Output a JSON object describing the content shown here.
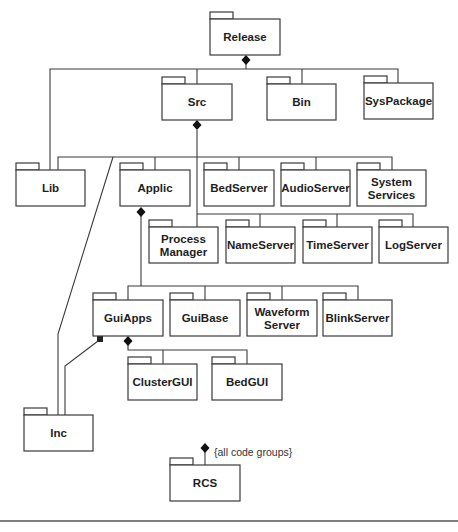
{
  "diagram": {
    "type": "UML package diagram",
    "packages": {
      "release": {
        "label": [
          "Release"
        ]
      },
      "src": {
        "label": [
          "Src"
        ]
      },
      "bin": {
        "label": [
          "Bin"
        ]
      },
      "syspackage": {
        "label": [
          "SysPackage"
        ]
      },
      "lib": {
        "label": [
          "Lib"
        ]
      },
      "applic": {
        "label": [
          "Applic"
        ]
      },
      "bedserver": {
        "label": [
          "BedServer"
        ]
      },
      "audioserver": {
        "label": [
          "AudioServer"
        ]
      },
      "systemservices": {
        "label": [
          "System",
          "Services"
        ]
      },
      "processmanager": {
        "label": [
          "Process",
          "Manager"
        ]
      },
      "nameserver": {
        "label": [
          "NameServer"
        ]
      },
      "timeserver": {
        "label": [
          "TimeServer"
        ]
      },
      "logserver": {
        "label": [
          "LogServer"
        ]
      },
      "guiapps": {
        "label": [
          "GuiApps"
        ]
      },
      "guibase": {
        "label": [
          "GuiBase"
        ]
      },
      "waveformserver": {
        "label": [
          "Waveform",
          "Server"
        ]
      },
      "blinkserver": {
        "label": [
          "BlinkServer"
        ]
      },
      "clustergui": {
        "label": [
          "ClusterGUI"
        ]
      },
      "bedgui": {
        "label": [
          "BedGUI"
        ]
      },
      "inc": {
        "label": [
          "Inc"
        ]
      },
      "rcs": {
        "label": [
          "RCS"
        ]
      }
    },
    "relations": [
      {
        "kind": "composition",
        "whole": "Release",
        "parts": [
          "Src",
          "Bin",
          "SysPackage",
          "Lib"
        ]
      },
      {
        "kind": "composition",
        "whole": "Src",
        "parts": [
          "Lib",
          "Applic",
          "BedServer",
          "AudioServer",
          "System Services",
          "Process Manager",
          "NameServer",
          "TimeServer",
          "LogServer",
          "Inc"
        ]
      },
      {
        "kind": "composition",
        "whole": "Applic",
        "parts": [
          "GuiApps",
          "GuiBase",
          "Waveform Server",
          "BlinkServer"
        ]
      },
      {
        "kind": "composition",
        "whole": "GuiApps",
        "parts": [
          "ClusterGUI",
          "BedGUI"
        ]
      },
      {
        "kind": "aggregation",
        "whole": "GuiApps",
        "parts": [
          "Inc"
        ]
      },
      {
        "kind": "composition",
        "whole": "RCS",
        "parts": [
          "all code groups"
        ]
      }
    ],
    "rcs_note": "{all code groups}"
  }
}
